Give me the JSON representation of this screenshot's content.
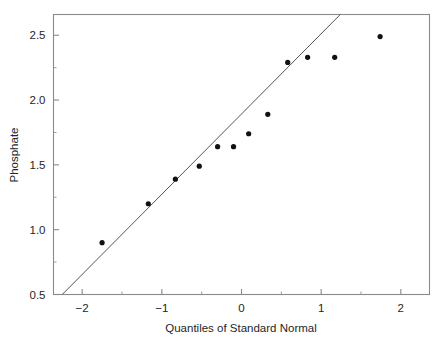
{
  "chart_data": {
    "type": "scatter",
    "title": "",
    "subtitle": "",
    "xlabel": "Quantiles of Standard Normal",
    "ylabel": "Phosphate",
    "xlim": [
      -2.36,
      2.36
    ],
    "ylim": [
      0.5,
      2.66
    ],
    "xticks": [
      -2,
      -1,
      0,
      1,
      2
    ],
    "xtick_labels": [
      "-2",
      "-1",
      "0",
      "1",
      "2"
    ],
    "xticks_minor": [
      -1.5,
      -0.5,
      0.5,
      1.5
    ],
    "yticks": [
      0.5,
      1.0,
      1.5,
      2.0,
      2.5
    ],
    "ytick_labels": [
      "0.5",
      "1.0",
      "1.5",
      "2.0",
      "2.5"
    ],
    "yticks_minor": [
      0.75,
      1.25,
      1.75,
      2.25
    ],
    "grid": false,
    "legend": null,
    "frame": "box",
    "point_color": "#111111",
    "line_color": "#555555",
    "axis_color": "#8a8a8a",
    "series": [
      {
        "name": "Phosphate sample quantiles",
        "type": "scatter",
        "x": [
          -1.75,
          -1.17,
          -0.83,
          -0.53,
          -0.3,
          -0.1,
          0.09,
          0.33,
          0.58,
          0.83,
          1.17,
          1.74
        ],
        "y": [
          0.9,
          1.2,
          1.39,
          1.49,
          1.64,
          1.64,
          1.74,
          1.89,
          2.29,
          2.33,
          2.33,
          2.49
        ]
      },
      {
        "name": "Reference line",
        "type": "line",
        "x": [
          -2.25,
          1.24
        ],
        "y": [
          0.5,
          2.66
        ]
      }
    ]
  },
  "axes": {
    "y_title": "Phosphate",
    "x_title": "Quantiles of Standard Normal"
  }
}
